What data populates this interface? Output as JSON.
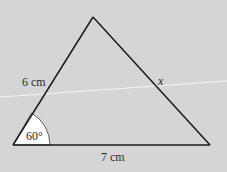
{
  "diagram": {
    "type": "triangle",
    "vertices": {
      "apex": [
        93,
        17
      ],
      "bottom_left": [
        13,
        145
      ],
      "bottom_right": [
        210,
        145
      ]
    },
    "labels": {
      "left_side": "6 cm",
      "base": "7 cm",
      "right_side": "x",
      "angle": "60°"
    },
    "colors": {
      "background": "#d5d5d5",
      "line": "#1a1a1a",
      "angle_fill": "#ffffff",
      "scan_line": "#f4f4f4"
    }
  }
}
